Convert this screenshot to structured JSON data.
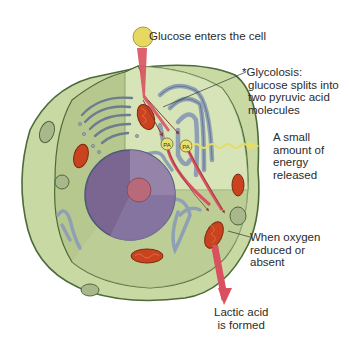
{
  "diagram": {
    "labels": {
      "glucose": {
        "badge": "Gl",
        "text": "Glucose enters the cell"
      },
      "glycolysis": {
        "lines": [
          "*Glycolosis:",
          "glucose splits into",
          "two pyruvic acid",
          "molecules"
        ]
      },
      "energy": {
        "lines": [
          "A small",
          "amount of",
          "energy",
          "released"
        ]
      },
      "oxygen": {
        "lines": [
          "When oxygen",
          "reduced or",
          "absent"
        ]
      },
      "lactic": {
        "lines": [
          "Lactic acid",
          "is formed"
        ]
      }
    },
    "pyruvic_markers": [
      "PA",
      "PA"
    ],
    "colors": {
      "cell_outer": "#c9d9a4",
      "cell_inner": "#b7c88f",
      "cut_face": "#d6e4b8",
      "membrane": "#4d6a3a",
      "nucleus": "#7a6690",
      "nucleolus": "#b86a7a",
      "er": "#8fa0b4",
      "mitochondria": "#c9431f",
      "arrow": "#d9515f",
      "glucose_ball": "#e8d760",
      "energy_wave": "#e4dd6a"
    }
  }
}
